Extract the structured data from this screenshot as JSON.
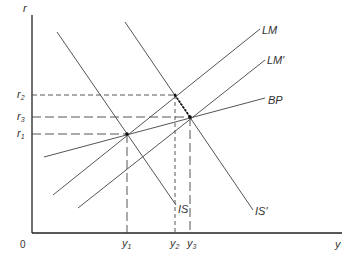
{
  "diagram": {
    "axes": {
      "y_label": "r",
      "x_label": "y",
      "origin_label": "0"
    },
    "curves": [
      {
        "id": "LM",
        "label": "LM"
      },
      {
        "id": "LM_prime",
        "label": "LM′"
      },
      {
        "id": "BP",
        "label": "BP"
      },
      {
        "id": "IS",
        "label": "IS"
      },
      {
        "id": "IS_prime",
        "label": "IS′"
      }
    ],
    "r_levels": [
      {
        "id": "r2",
        "base": "r",
        "sub": "2"
      },
      {
        "id": "r3",
        "base": "r",
        "sub": "3"
      },
      {
        "id": "r1",
        "base": "r",
        "sub": "1"
      }
    ],
    "y_levels": [
      {
        "id": "y1",
        "base": "y",
        "sub": "1"
      },
      {
        "id": "y2",
        "base": "y",
        "sub": "2"
      },
      {
        "id": "y3",
        "base": "y",
        "sub": "3"
      }
    ],
    "colors": {
      "line": "#555555",
      "axis": "#222222",
      "text": "#333333"
    }
  }
}
